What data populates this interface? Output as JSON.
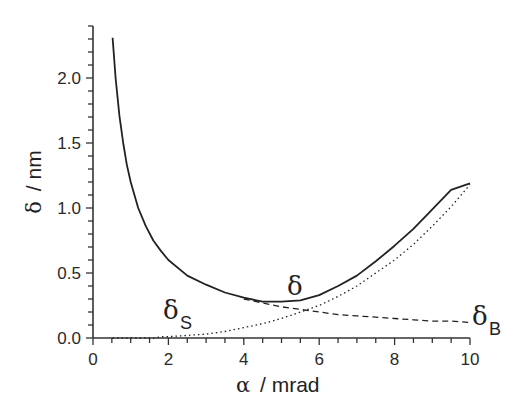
{
  "chart_data": {
    "type": "line",
    "title": "",
    "xlabel": "α / mrad",
    "ylabel": "δ / nm",
    "xlim": [
      0,
      10
    ],
    "ylim": [
      0,
      2.4
    ],
    "x_ticks": [
      0,
      2,
      4,
      6,
      8,
      10
    ],
    "x_tick_labels": [
      "0",
      "2",
      "4",
      "6",
      "8",
      "10"
    ],
    "y_ticks": [
      0.0,
      0.5,
      1.0,
      1.5,
      2.0
    ],
    "y_tick_labels": [
      "0.0",
      "0.5",
      "1.0",
      "1.5",
      "2.0"
    ],
    "x_minor_step": 0.5,
    "y_minor_step": 0.1,
    "grid": false,
    "legend": "none (inline curve labels)",
    "x": [
      0.52,
      0.6,
      0.7,
      0.8,
      0.9,
      1.0,
      1.2,
      1.4,
      1.6,
      1.8,
      2.0,
      2.5,
      3.0,
      3.5,
      4.0,
      4.5,
      5.0,
      5.5,
      6.0,
      6.5,
      7.0,
      7.5,
      8.0,
      8.5,
      9.0,
      9.5,
      10.0
    ],
    "series": [
      {
        "name": "δ",
        "style": "solid",
        "values": [
          2.31,
          2.0,
          1.71,
          1.5,
          1.33,
          1.2,
          1.0,
          0.86,
          0.75,
          0.67,
          0.6,
          0.48,
          0.41,
          0.35,
          0.31,
          0.28,
          0.28,
          0.29,
          0.33,
          0.4,
          0.48,
          0.59,
          0.71,
          0.84,
          0.99,
          1.14,
          1.19
        ]
      },
      {
        "name": "δS",
        "style": "dotted",
        "values": [
          0.0,
          0.0,
          0.0,
          0.0,
          0.0,
          0.0,
          0.0,
          0.0,
          0.0,
          0.01,
          0.01,
          0.02,
          0.03,
          0.05,
          0.08,
          0.11,
          0.15,
          0.2,
          0.25,
          0.32,
          0.4,
          0.5,
          0.6,
          0.72,
          0.86,
          1.01,
          1.18
        ]
      },
      {
        "name": "δB",
        "style": "dashed",
        "values": [
          null,
          null,
          null,
          null,
          null,
          null,
          null,
          null,
          null,
          null,
          null,
          null,
          null,
          null,
          0.3,
          0.27,
          0.24,
          0.22,
          0.2,
          0.18,
          0.17,
          0.16,
          0.15,
          0.14,
          0.13,
          0.13,
          0.12
        ]
      }
    ],
    "annotations": [
      {
        "text": "δ",
        "x": 5.3,
        "y": 0.33
      },
      {
        "text": "δS",
        "x": 2.0,
        "y": 0.08
      },
      {
        "text": "δB",
        "x": 10.3,
        "y": 0.07
      }
    ]
  },
  "labels": {
    "xlabel_alpha": "α",
    "xlabel_unit": "/ mrad",
    "ylabel_delta": "δ",
    "ylabel_unit": "/ nm",
    "delta": "δ",
    "delta_s_main": "δ",
    "delta_s_sub": "S",
    "delta_b_main": "δ",
    "delta_b_sub": "B"
  },
  "colors": {
    "line": "#222222",
    "axis": "#333333",
    "text": "#2a2a2a"
  }
}
